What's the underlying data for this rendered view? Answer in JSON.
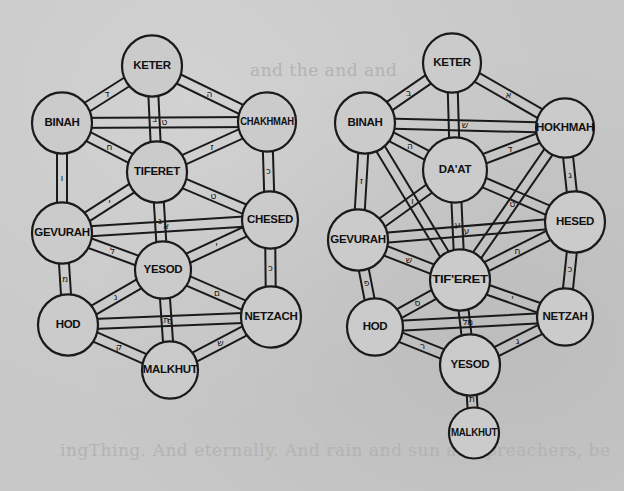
{
  "background": {
    "ghost_lines": [
      {
        "text": "ingThing. And eternally. And rain and sun and preachers, be",
        "x": 60,
        "y": 440
      },
      {
        "text": "and the and and",
        "x": 250,
        "y": 60
      }
    ]
  },
  "diagrams": [
    {
      "id": "left-tree",
      "nodes": [
        {
          "key": "keter",
          "label": "KETER",
          "x": 152,
          "y": 66,
          "r": 30
        },
        {
          "key": "binah",
          "label": "BINAH",
          "x": 62,
          "y": 123,
          "r": 30
        },
        {
          "key": "chakhmah",
          "label": "CHAKHMAH",
          "x": 267,
          "y": 122,
          "r": 29
        },
        {
          "key": "tiferet",
          "label": "TIFERET",
          "x": 157,
          "y": 172,
          "r": 30
        },
        {
          "key": "gevurah",
          "label": "GEVURAH",
          "x": 62,
          "y": 233,
          "r": 30
        },
        {
          "key": "chesed",
          "label": "CHESED",
          "x": 270,
          "y": 220,
          "r": 28
        },
        {
          "key": "yesod",
          "label": "YESOD",
          "x": 163,
          "y": 270,
          "r": 28
        },
        {
          "key": "hod",
          "label": "HOD",
          "x": 68,
          "y": 325,
          "r": 30
        },
        {
          "key": "netzach",
          "label": "NETZACH",
          "x": 271,
          "y": 317,
          "r": 30
        },
        {
          "key": "malkhut",
          "label": "MALKHUT",
          "x": 170,
          "y": 370,
          "r": 28
        }
      ],
      "paths": [
        {
          "from": "keter",
          "to": "binah",
          "letter": "ד"
        },
        {
          "from": "keter",
          "to": "chakhmah",
          "letter": "ה"
        },
        {
          "from": "keter",
          "to": "tiferet",
          "letter": "ב"
        },
        {
          "from": "binah",
          "to": "chakhmah",
          "letter": "ט"
        },
        {
          "from": "binah",
          "to": "tiferet",
          "letter": "ח"
        },
        {
          "from": "chakhmah",
          "to": "tiferet",
          "letter": "ז"
        },
        {
          "from": "binah",
          "to": "gevurah",
          "letter": "ו"
        },
        {
          "from": "chakhmah",
          "to": "chesed",
          "letter": "כ"
        },
        {
          "from": "tiferet",
          "to": "gevurah",
          "letter": "י"
        },
        {
          "from": "tiferet",
          "to": "chesed",
          "letter": "ט"
        },
        {
          "from": "tiferet",
          "to": "yesod",
          "letter": "ג"
        },
        {
          "from": "gevurah",
          "to": "chesed",
          "letter": "א"
        },
        {
          "from": "gevurah",
          "to": "yesod",
          "letter": "ל"
        },
        {
          "from": "chesed",
          "to": "yesod",
          "letter": "י"
        },
        {
          "from": "gevurah",
          "to": "hod",
          "letter": "מ"
        },
        {
          "from": "chesed",
          "to": "netzach",
          "letter": "כ"
        },
        {
          "from": "yesod",
          "to": "hod",
          "letter": "נ"
        },
        {
          "from": "yesod",
          "to": "netzach",
          "letter": "ם"
        },
        {
          "from": "yesod",
          "to": "malkhut",
          "letter": "ת"
        },
        {
          "from": "hod",
          "to": "netzach",
          "letter": "פ"
        },
        {
          "from": "hod",
          "to": "malkhut",
          "letter": "ק"
        },
        {
          "from": "netzach",
          "to": "malkhut",
          "letter": "ש"
        }
      ]
    },
    {
      "id": "right-tree",
      "nodes": [
        {
          "key": "keter",
          "label": "KETER",
          "x": 452,
          "y": 63,
          "r": 29
        },
        {
          "key": "binah",
          "label": "BINAH",
          "x": 365,
          "y": 123,
          "r": 30
        },
        {
          "key": "chokhmah",
          "label": "HOKHMAH",
          "x": 565,
          "y": 128,
          "r": 29
        },
        {
          "key": "daat",
          "label": "DA'AT",
          "x": 455,
          "y": 170,
          "r": 32
        },
        {
          "key": "gevurah",
          "label": "GEVURAH",
          "x": 358,
          "y": 240,
          "r": 30
        },
        {
          "key": "hesed",
          "label": "HESED",
          "x": 575,
          "y": 222,
          "r": 30
        },
        {
          "key": "tiferet",
          "label": "TIF'ERET",
          "x": 460,
          "y": 280,
          "r": 30
        },
        {
          "key": "hod",
          "label": "HOD",
          "x": 375,
          "y": 327,
          "r": 28
        },
        {
          "key": "netzah",
          "label": "NETZAH",
          "x": 565,
          "y": 317,
          "r": 28
        },
        {
          "key": "yesod",
          "label": "YESOD",
          "x": 470,
          "y": 365,
          "r": 30
        },
        {
          "key": "malkhut",
          "label": "MALKHUT",
          "x": 474,
          "y": 433,
          "r": 25
        }
      ],
      "paths": [
        {
          "from": "keter",
          "to": "binah",
          "letter": "ב"
        },
        {
          "from": "keter",
          "to": "chokhmah",
          "letter": "א"
        },
        {
          "from": "keter",
          "to": "daat",
          "letter": ""
        },
        {
          "from": "binah",
          "to": "chokhmah",
          "letter": "ש"
        },
        {
          "from": "binah",
          "to": "daat",
          "letter": "ה"
        },
        {
          "from": "chokhmah",
          "to": "daat",
          "letter": "ד"
        },
        {
          "from": "binah",
          "to": "gevurah",
          "letter": "ז"
        },
        {
          "from": "binah",
          "to": "tiferet",
          "letter": "ו"
        },
        {
          "from": "chokhmah",
          "to": "hesed",
          "letter": "ג"
        },
        {
          "from": "chokhmah",
          "to": "tiferet",
          "letter": "ט"
        },
        {
          "from": "daat",
          "to": "gevurah",
          "letter": ""
        },
        {
          "from": "daat",
          "to": "hesed",
          "letter": ""
        },
        {
          "from": "daat",
          "to": "tiferet",
          "letter": "ע"
        },
        {
          "from": "gevurah",
          "to": "hesed",
          "letter": "ע"
        },
        {
          "from": "gevurah",
          "to": "tiferet",
          "letter": "ש"
        },
        {
          "from": "hesed",
          "to": "tiferet",
          "letter": "ח"
        },
        {
          "from": "gevurah",
          "to": "hod",
          "letter": "פ"
        },
        {
          "from": "hesed",
          "to": "netzah",
          "letter": "כ"
        },
        {
          "from": "tiferet",
          "to": "hod",
          "letter": "ס"
        },
        {
          "from": "tiferet",
          "to": "netzah",
          "letter": "י"
        },
        {
          "from": "tiferet",
          "to": "yesod",
          "letter": "ל"
        },
        {
          "from": "hod",
          "to": "netzah",
          "letter": "מ"
        },
        {
          "from": "hod",
          "to": "yesod",
          "letter": "ר"
        },
        {
          "from": "netzah",
          "to": "yesod",
          "letter": "ג"
        },
        {
          "from": "yesod",
          "to": "malkhut",
          "letter": "ת"
        }
      ]
    }
  ]
}
